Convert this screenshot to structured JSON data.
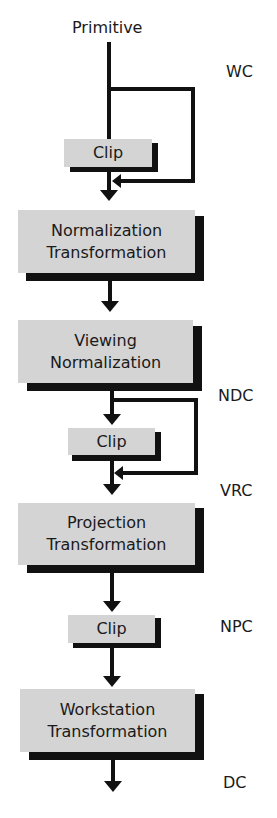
{
  "diagram": {
    "input_label": "Primitive",
    "coordinate_labels": {
      "wc": "WC",
      "ndc": "NDC",
      "vrc": "VRC",
      "npc": "NPC",
      "dc": "DC"
    },
    "stages": [
      {
        "id": "clip1",
        "lines": [
          "Clip"
        ]
      },
      {
        "id": "normalization",
        "lines": [
          "Normalization",
          "Transformation"
        ]
      },
      {
        "id": "viewing",
        "lines": [
          "Viewing",
          "Normalization"
        ]
      },
      {
        "id": "clip2",
        "lines": [
          "Clip"
        ]
      },
      {
        "id": "projection",
        "lines": [
          "Projection",
          "Transformation"
        ]
      },
      {
        "id": "clip3",
        "lines": [
          "Clip"
        ]
      },
      {
        "id": "workstation",
        "lines": [
          "Workstation",
          "Transformation"
        ]
      }
    ],
    "colors": {
      "box_fill": "#d4d4d4",
      "line": "#111111",
      "background": "#ffffff"
    }
  }
}
